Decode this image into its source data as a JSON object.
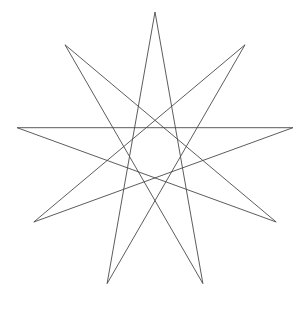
{
  "figure": {
    "background_color": "#ffffff",
    "stroke_color": "#4a4a4a",
    "stroke_width": 0.9,
    "canvas": {
      "width": 308,
      "height": 310
    }
  },
  "chart_data": {
    "type": "line",
    "subtitle": "",
    "xlabel": "",
    "ylabel": "",
    "grid": false,
    "legend": "none",
    "xlim": [
      0,
      308
    ],
    "ylim": [
      0,
      310
    ],
    "polygon": {
      "n_points": 9,
      "step": 4,
      "center_x": 155,
      "center_y": 152,
      "radius": 140,
      "start_angle_deg": -90
    },
    "vertices": [
      {
        "index": 0,
        "angle_deg": -90,
        "x": 155.0,
        "y": 12.0,
        "label": "top"
      },
      {
        "index": 1,
        "angle_deg": -50,
        "x": 245.0,
        "y": 44.8,
        "label": "upper-right"
      },
      {
        "index": 2,
        "angle_deg": -10,
        "x": 292.9,
        "y": 127.7,
        "label": "right-upper"
      },
      {
        "index": 3,
        "angle_deg": 30,
        "x": 276.2,
        "y": 222.0,
        "label": "lower-right"
      },
      {
        "index": 4,
        "angle_deg": 70,
        "x": 202.9,
        "y": 283.6,
        "label": "bottom-right"
      },
      {
        "index": 5,
        "angle_deg": 110,
        "x": 107.1,
        "y": 283.6,
        "label": "bottom-left"
      },
      {
        "index": 6,
        "angle_deg": 150,
        "x": 33.8,
        "y": 222.0,
        "label": "lower-left"
      },
      {
        "index": 7,
        "angle_deg": 190,
        "x": 17.1,
        "y": 127.7,
        "label": "left-upper"
      },
      {
        "index": 8,
        "angle_deg": 230,
        "x": 65.0,
        "y": 44.8,
        "label": "upper-left"
      }
    ],
    "draw_order_indices": [
      0,
      4,
      8,
      3,
      7,
      2,
      6,
      1,
      5,
      0
    ],
    "edges": [
      {
        "from": 0,
        "to": 4
      },
      {
        "from": 4,
        "to": 8
      },
      {
        "from": 8,
        "to": 3
      },
      {
        "from": 3,
        "to": 7
      },
      {
        "from": 7,
        "to": 2
      },
      {
        "from": 2,
        "to": 6
      },
      {
        "from": 6,
        "to": 1
      },
      {
        "from": 1,
        "to": 5
      },
      {
        "from": 5,
        "to": 0
      }
    ],
    "annotations": []
  }
}
